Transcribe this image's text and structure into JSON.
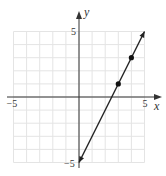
{
  "chart_data": {
    "type": "line",
    "title": "",
    "xlabel": "x",
    "ylabel": "y",
    "xlim": [
      -5,
      5
    ],
    "ylim": [
      -5,
      5
    ],
    "grid": true,
    "grid_step": 1,
    "x_tick_labels": [
      {
        "value": -5,
        "label": "−5"
      },
      {
        "value": 5,
        "label": "5"
      }
    ],
    "y_tick_labels": [
      {
        "value": 5,
        "label": "5"
      },
      {
        "value": -5,
        "label": "−5"
      }
    ],
    "series": [
      {
        "name": "y = 2x − 5",
        "kind": "line",
        "slope": 2,
        "intercept": -5,
        "x_range": [
          0,
          5
        ],
        "arrows": "both",
        "color": "#222222"
      }
    ],
    "points": [
      {
        "x": 3,
        "y": 1
      },
      {
        "x": 4,
        "y": 3
      }
    ]
  }
}
